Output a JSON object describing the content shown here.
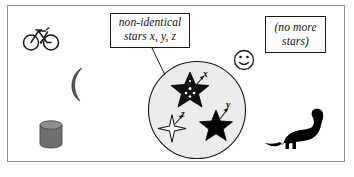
{
  "figure": {
    "background_color": "#ffffff",
    "frame_color": "#8c8c8c"
  },
  "callouts": [
    {
      "name": "non-identical-stars-label",
      "line1": "non-identical",
      "line2": "stars x, y, z",
      "style": "italic",
      "has_leader_line": true
    },
    {
      "name": "no-more-stars-label",
      "line1": "(no more",
      "line2": "stars)",
      "style": "italic",
      "has_leader_line": false
    }
  ],
  "circle": {
    "name": "star-region-circle",
    "fill_color": "#ececec",
    "stroke_color": "#1a1a1a"
  },
  "stars": [
    {
      "name": "star-x",
      "label": "x",
      "shape": "5-point",
      "fill": "black-with-white-dots",
      "fill_color": "#111111",
      "has_arrow": true
    },
    {
      "name": "star-y",
      "label": "y",
      "shape": "5-point",
      "fill": "solid-black",
      "fill_color": "#000000",
      "has_arrow": true
    },
    {
      "name": "star-z",
      "label": "z",
      "shape": "4-point-sparkle",
      "fill": "white-outline",
      "fill_color": "#ffffff",
      "has_arrow": true
    }
  ],
  "outside_objects": [
    {
      "name": "bicycle-icon",
      "fill_color": "#1a1a1a"
    },
    {
      "name": "crescent-moon-icon",
      "fill_color": "#555555"
    },
    {
      "name": "cylinder-can-icon",
      "fill_color": "#777777"
    },
    {
      "name": "smiley-face-icon",
      "fill_color": "#ffffff"
    },
    {
      "name": "dinosaur-icon",
      "fill_color": "#000000"
    }
  ]
}
